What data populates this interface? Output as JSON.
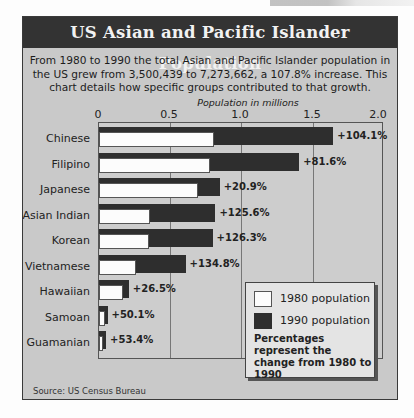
{
  "header": {
    "title": "US Asian and Pacific Islander Population"
  },
  "intro": {
    "text": "From 1980 to 1990 the total Asian and Pacific Islander population in the US grew from 3,500,439 to 7,273,662, a 107.8% increase.  This chart details how specific groups contributed to that growth."
  },
  "axis": {
    "title": "Population in millions",
    "ticks": [
      "0",
      "0.5",
      "1.0",
      "1.5",
      "2.0"
    ]
  },
  "legend": {
    "item_1980": "1980 population",
    "item_1990": "1990 population",
    "note": "Percentages represent the change from 1980 to 1990",
    "color_1980": "#fcfcfc",
    "color_1990": "#2e2e2e"
  },
  "source": "Source: US Census Bureau",
  "chart_data": {
    "type": "bar",
    "orientation": "horizontal",
    "title": "US Asian and Pacific Islander Population",
    "subtitle": "From 1980 to 1990 the total Asian and Pacific Islander population in the US grew from 3,500,439 to 7,273,662, a 107.8% increase. This chart details how specific groups contributed to that growth.",
    "xlabel": "Population in millions",
    "ylabel": "",
    "xlim": [
      0,
      2.0
    ],
    "xticks": [
      0,
      0.5,
      1.0,
      1.5,
      2.0
    ],
    "grid": true,
    "legend_position": "bottom-right",
    "categories": [
      "Chinese",
      "Filipino",
      "Japanese",
      "Asian Indian",
      "Korean",
      "Vietnamese",
      "Hawaiian",
      "Samoan",
      "Guamanian"
    ],
    "series": [
      {
        "name": "1980 population",
        "values": [
          0.81,
          0.78,
          0.7,
          0.36,
          0.35,
          0.26,
          0.17,
          0.04,
          0.03
        ]
      },
      {
        "name": "1990 population",
        "values": [
          1.65,
          1.41,
          0.85,
          0.82,
          0.8,
          0.61,
          0.21,
          0.06,
          0.05
        ]
      }
    ],
    "annotations": [
      "+104.1%",
      "+81.6%",
      "+20.9%",
      "+125.6%",
      "+126.3%",
      "+134.8%",
      "+26.5%",
      "+50.1%",
      "+53.4%"
    ],
    "note": "Percentages represent the change from 1980 to 1990",
    "source": "Source: US Census Bureau"
  }
}
